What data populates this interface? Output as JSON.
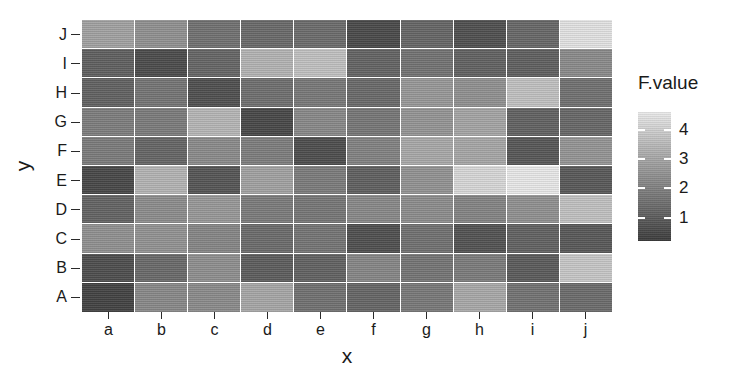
{
  "chart_data": {
    "type": "heatmap",
    "title": "",
    "xlabel": "x",
    "ylabel": "y",
    "x_categories": [
      "a",
      "b",
      "c",
      "d",
      "e",
      "f",
      "g",
      "h",
      "i",
      "j"
    ],
    "y_categories": [
      "A",
      "B",
      "C",
      "D",
      "E",
      "F",
      "G",
      "H",
      "I",
      "J"
    ],
    "y_categories_top_to_bottom": [
      "J",
      "I",
      "H",
      "G",
      "F",
      "E",
      "D",
      "C",
      "B",
      "A"
    ],
    "legend": {
      "title": "F.value",
      "ticks": [
        4,
        3,
        2,
        1
      ],
      "position": "right",
      "scale_min": 0.2,
      "scale_max": 4.6,
      "low_color": "#3c3c3c",
      "high_color": "#ebebeb"
    },
    "grid": false,
    "panel_background": "#ffffff",
    "cell_border_color": "#ffffff",
    "rows_top_to_bottom": [
      {
        "y": "J",
        "values": [
          2.85,
          2.45,
          1.7,
          1.55,
          1.6,
          0.8,
          1.45,
          0.95,
          1.5,
          4.35
        ]
      },
      {
        "y": "I",
        "values": [
          1.3,
          0.85,
          1.45,
          3.25,
          3.55,
          1.4,
          1.75,
          1.35,
          1.3,
          2.3
        ]
      },
      {
        "y": "H",
        "values": [
          1.35,
          1.8,
          0.95,
          1.65,
          1.9,
          1.55,
          2.6,
          2.45,
          3.55,
          1.7
        ]
      },
      {
        "y": "G",
        "values": [
          2.0,
          1.95,
          3.3,
          0.75,
          2.25,
          1.85,
          2.55,
          2.9,
          1.35,
          1.5
        ]
      },
      {
        "y": "F",
        "values": [
          1.95,
          1.45,
          2.3,
          2.0,
          0.9,
          2.1,
          3.0,
          2.95,
          1.1,
          2.55
        ]
      },
      {
        "y": "E",
        "values": [
          0.75,
          3.25,
          1.05,
          2.85,
          1.95,
          1.3,
          2.5,
          4.1,
          4.45,
          1.15
        ]
      },
      {
        "y": "D",
        "values": [
          1.4,
          2.35,
          2.6,
          1.95,
          1.85,
          2.25,
          2.35,
          2.15,
          2.45,
          3.55
        ]
      },
      {
        "y": "C",
        "values": [
          2.45,
          2.5,
          2.2,
          1.6,
          1.8,
          0.95,
          1.7,
          1.0,
          1.35,
          1.15
        ]
      },
      {
        "y": "B",
        "values": [
          0.9,
          1.55,
          2.4,
          1.25,
          1.35,
          2.2,
          1.8,
          1.95,
          1.2,
          3.7
        ]
      },
      {
        "y": "A",
        "values": [
          0.65,
          2.25,
          2.3,
          2.95,
          1.7,
          1.45,
          1.9,
          3.0,
          1.75,
          1.6
        ]
      }
    ]
  }
}
